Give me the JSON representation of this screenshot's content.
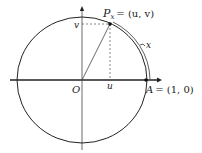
{
  "diagram": {
    "type": "unit-circle",
    "labels": {
      "point_p": "P",
      "point_p_sub": "x",
      "point_p_eq": "= (u, v)",
      "origin": "O",
      "u": "u",
      "v": "v",
      "arc": "x",
      "point_a": "A",
      "point_a_eq": "= (1, 0)"
    },
    "colors": {
      "stroke": "#222222",
      "dashed": "#555555",
      "background": "#ffffff"
    }
  }
}
